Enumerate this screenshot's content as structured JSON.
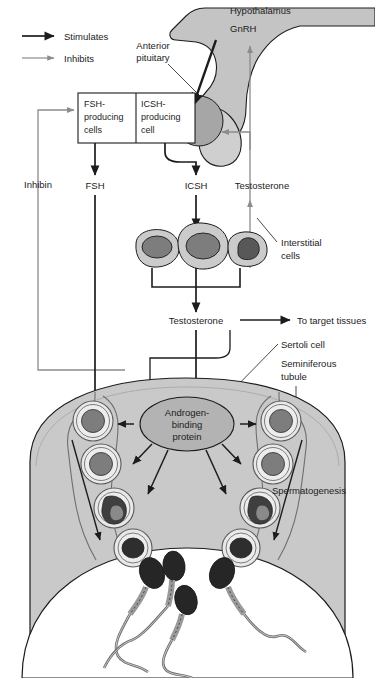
{
  "figure": {
    "type": "biological-flow-diagram"
  },
  "legend": {
    "items": [
      {
        "label": "Stimulates",
        "arrow": "stimulates-arrow",
        "color": "#1c1c1c",
        "style": "thick-black"
      },
      {
        "label": "Inhibits",
        "arrow": "inhibits-arrow",
        "color": "#8c8c8c",
        "style": "thin-gray"
      }
    ]
  },
  "brain": {
    "hypothalamus_label": "Hypothalamus",
    "gnrh_label": "GnRH",
    "anterior_pituitary_label_line1": "Anterior",
    "anterior_pituitary_label_line2": "pituitary"
  },
  "pituitary_box": {
    "cells": [
      {
        "line1": "FSH-",
        "line2": "producing",
        "line3": "cells"
      },
      {
        "line1": "ICSH-",
        "line2": "producing",
        "line3": "cell"
      }
    ]
  },
  "hormones": {
    "inhibin": "Inhibin",
    "fsh": "FSH",
    "icsh": "ICSH",
    "testosterone_upper": "Testosterone",
    "testosterone_lower": "Testosterone",
    "to_target_tissues": "To target tissues"
  },
  "interstitial": {
    "label_line1": "Interstitial",
    "label_line2": "cells",
    "cell_count": 3
  },
  "tubule": {
    "sertoli_label": "Sertoli cell",
    "seminiferous_line1": "Seminiferous",
    "seminiferous_line2": "tubule",
    "spermatogenesis_label": "Spermatogenesis",
    "abp_line1": "Androgen-",
    "abp_line2": "binding",
    "abp_line3": "protein",
    "germ_cell_count": 8,
    "sperm_count": 4
  },
  "colors": {
    "stroke": "#1c1c1c",
    "inhibit_gray": "#8c8c8c",
    "tissue_gray": "#c9c9c9",
    "brain_gray": "#c4c4c4",
    "pituitary_gray": "#a6a6a6",
    "nucleus_gray": "#7d7d7d",
    "nucleus_dark": "#585858",
    "sperm_head": "#262626",
    "abp_fill": "#b3b3b3",
    "lumen": "#ffffff",
    "text": "#1c1c1c"
  }
}
